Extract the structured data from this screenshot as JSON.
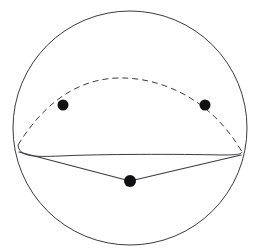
{
  "figure": {
    "background_color": "#ffffff",
    "stroke_color": "#3a3a42",
    "point_color": "#111114"
  },
  "chart_data": {
    "type": "scatter",
    "xlabel": "",
    "ylabel": "",
    "xlim": [
      0,
      259
    ],
    "ylim": [
      0,
      251
    ],
    "grid": false,
    "legend": "none",
    "sphere": {
      "center_x": 130,
      "center_y": 128,
      "radius": 117,
      "top_y": 13,
      "bottom_y": 244,
      "left_x": 13,
      "right_x": 247
    },
    "cusp_points": [
      {
        "name": "left-cusp",
        "x": 18,
        "y": 145
      },
      {
        "name": "right-cusp",
        "x": 242,
        "y": 152
      }
    ],
    "hidden_arc": {
      "style": "dashed",
      "start_x": 18,
      "start_y": 145,
      "apex_x": 124,
      "apex_y": 88,
      "end_x": 242,
      "end_y": 152
    },
    "front_arc": {
      "style": "solid",
      "start_x": 18,
      "start_y": 145,
      "sag_x": 130,
      "sag_y": 155,
      "end_x": 242,
      "end_y": 152
    },
    "vertices": [
      {
        "name": "vertex-left",
        "x": 63,
        "y": 105,
        "radius": 5.5
      },
      {
        "name": "vertex-right",
        "x": 205,
        "y": 105,
        "radius": 5.5
      },
      {
        "name": "vertex-bottom",
        "x": 130,
        "y": 181,
        "radius": 6
      }
    ],
    "edges": [
      {
        "name": "edge-left-to-bottom",
        "from": "left-cusp",
        "to": "vertex-bottom"
      },
      {
        "name": "edge-bottom-to-right",
        "from": "vertex-bottom",
        "to": "right-cusp"
      }
    ]
  }
}
